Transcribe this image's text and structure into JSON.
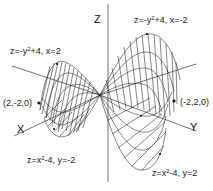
{
  "figure": {
    "axes": {
      "x": {
        "label": "X"
      },
      "y": {
        "label": "Y"
      },
      "z": {
        "label": "Z"
      }
    },
    "annotations": {
      "curve_top_left": {
        "pre": "z=-y",
        "sup": "2",
        "post": "+4, x=2"
      },
      "curve_top_right": {
        "pre": "z=-y",
        "sup": "2",
        "post": "+4, x=-2"
      },
      "curve_bottom_left": {
        "pre": "z=x",
        "sup": "2",
        "post": "-4, y=-2"
      },
      "curve_bottom_right": {
        "pre": "z=x",
        "sup": "2",
        "post": "-4, y=2"
      },
      "point_left": "(2,-2,0)",
      "point_right": "(-2,2,0)"
    },
    "colors": {
      "line": "#222222",
      "background": "#ffffff"
    }
  }
}
